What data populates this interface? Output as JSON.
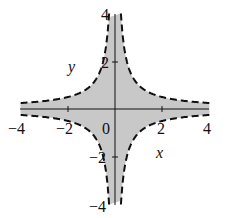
{
  "chart_data": {
    "type": "area",
    "title": "",
    "xlabel": "x",
    "ylabel": "y",
    "xlim": [
      -4,
      4
    ],
    "ylim": [
      -4,
      4
    ],
    "x_ticks": [
      "-4",
      "-2",
      "0",
      "2",
      "4"
    ],
    "y_ticks": [
      "4",
      "2",
      "-2",
      "-4"
    ],
    "origin_label": "0",
    "grid": false,
    "legend": null,
    "series": [
      {
        "name": "boundary xy = 1",
        "style": "dashed",
        "equation": "y = 1/x"
      },
      {
        "name": "boundary xy = -1",
        "style": "dashed",
        "equation": "y = -1/x"
      },
      {
        "name": "region |xy| < 1",
        "style": "filled",
        "fill": "#c8c8c8"
      }
    ]
  },
  "labels": {
    "x_axis": "x",
    "y_axis": "y",
    "tick_x_neg4": "−4",
    "tick_x_neg2": "−2",
    "tick_zero": "0",
    "tick_x_2": "2",
    "tick_x_4": "4",
    "tick_y_4": "4",
    "tick_y_2": "2",
    "tick_y_neg2": "−2",
    "tick_y_neg4": "−4"
  },
  "colors": {
    "fill": "#c8c8c8",
    "stroke": "#111111"
  }
}
